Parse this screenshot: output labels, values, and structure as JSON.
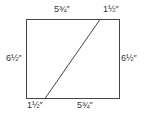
{
  "diagram": {
    "labels": {
      "top_left": "5¾″",
      "top_right": "1½″",
      "left": "6½″",
      "right": "6½″",
      "bottom_left": "1½″",
      "bottom_right": "5¾″"
    },
    "colors": {
      "stroke": "#444444",
      "text": "#333333"
    }
  }
}
